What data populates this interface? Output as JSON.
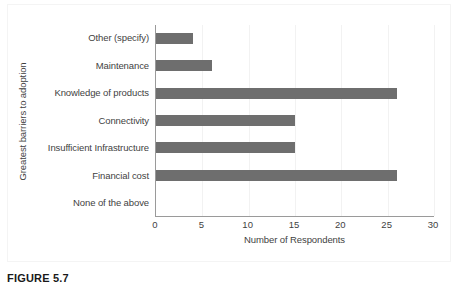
{
  "caption": "FIGURE 5.7",
  "chart_data": {
    "type": "bar",
    "orientation": "horizontal",
    "title": "",
    "xlabel": "Number of Respondents",
    "ylabel": "Greatest barriers to adoption",
    "categories": [
      "Other (specify)",
      "Maintenance",
      "Knowledge of products",
      "Connectivity",
      "Insufficient Infrastructure",
      "Financial cost",
      "None of the above"
    ],
    "values": [
      4,
      6,
      26,
      15,
      15,
      26,
      0
    ],
    "xlim": [
      0,
      30
    ],
    "xticks": [
      0,
      5,
      10,
      15,
      20,
      25,
      30
    ],
    "xtick_labels": [
      "0",
      "5",
      "10",
      "15",
      "20",
      "25",
      "30"
    ],
    "grid": "vertical-light",
    "legend": "none",
    "bar_color": "#6e6e6e",
    "axis_color": "#9a9a9a",
    "gridline_color": "#f2f2f2",
    "text_color": "#3f3f3f"
  }
}
